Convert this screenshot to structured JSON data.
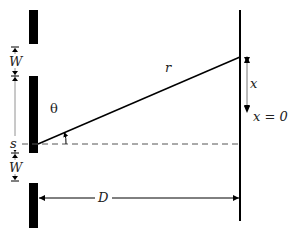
{
  "diagram": {
    "labels": {
      "slit_width": "W",
      "slit_width_lower": "W",
      "slit_separation": "s",
      "path_length": "r",
      "angle": "θ",
      "screen_position": "x",
      "origin": "x = 0",
      "distance": "D"
    },
    "colors": {
      "ink": "#000000",
      "annotation": "#555555",
      "background": "#ffffff"
    }
  }
}
